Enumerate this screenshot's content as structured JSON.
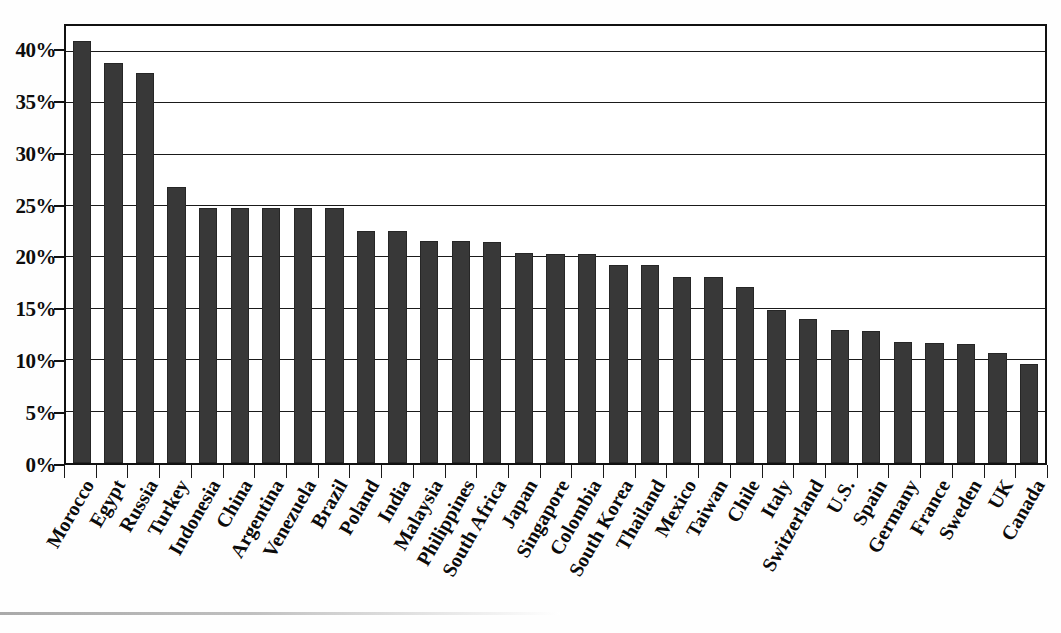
{
  "chart_data": {
    "type": "bar",
    "title": "",
    "subtitle": "",
    "xlabel": "",
    "ylabel": "",
    "ylim": [
      0,
      42.5
    ],
    "grid": true,
    "legend": "none",
    "orientation": "vertical",
    "bar_color": "#383838",
    "background_color": "#ffffff",
    "axis_color": "#111111",
    "y_ticks": [
      "0%",
      "5%",
      "10%",
      "15%",
      "20%",
      "25%",
      "30%",
      "35%",
      "40%"
    ],
    "y_tick_values": [
      0,
      5,
      10,
      15,
      20,
      25,
      30,
      35,
      40
    ],
    "value_suffix": "%",
    "categories": [
      "Morocco",
      "Egypt",
      "Russia",
      "Turkey",
      "Indonesia",
      "China",
      "Argentina",
      "Venezuela",
      "Brazil",
      "Poland",
      "India",
      "Malaysia",
      "Philippines",
      "South Africa",
      "Japan",
      "Singapore",
      "Colombia",
      "South Korea",
      "Thailand",
      "Mexico",
      "Taiwan",
      "Chile",
      "Italy",
      "Switzerland",
      "U.S.",
      "Spain",
      "Germany",
      "France",
      "Sweden",
      "UK",
      "Canada"
    ],
    "values": [
      41.0,
      38.9,
      37.9,
      26.8,
      24.8,
      24.8,
      24.8,
      24.8,
      24.8,
      22.6,
      22.6,
      21.6,
      21.6,
      21.5,
      20.4,
      20.3,
      20.3,
      19.3,
      19.3,
      18.1,
      18.1,
      17.1,
      14.9,
      14.0,
      12.9,
      12.8,
      11.8,
      11.7,
      11.6,
      10.7,
      9.6
    ]
  }
}
